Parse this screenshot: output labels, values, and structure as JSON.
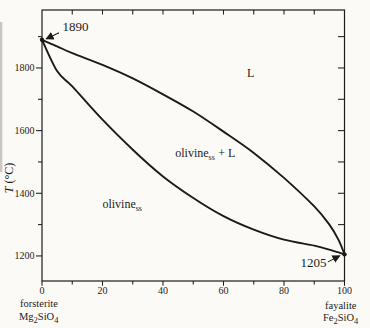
{
  "figure": {
    "background": "#fbfaf7",
    "line_color": "#1b1a18"
  },
  "chart_data": {
    "type": "line",
    "x_axis": {
      "min": 0,
      "max": 100,
      "major_ticks": [
        0,
        20,
        40,
        60,
        80,
        100
      ],
      "minor_ticks": [
        10,
        30,
        50,
        70,
        90
      ],
      "top_minor_ticks": [
        10,
        20,
        30,
        40,
        50,
        60,
        70,
        80,
        90
      ],
      "left_end": {
        "name": "forsterite",
        "formula_parts": [
          {
            "t": "Mg"
          },
          {
            "t": "2",
            "sub": true
          },
          {
            "t": "SiO"
          },
          {
            "t": "4",
            "sub": true
          }
        ]
      },
      "right_end": {
        "name": "fayalite",
        "formula_parts": [
          {
            "t": "Fe"
          },
          {
            "t": "2",
            "sub": true
          },
          {
            "t": "SiO"
          },
          {
            "t": "4",
            "sub": true
          }
        ]
      }
    },
    "y_axis": {
      "min": 1120,
      "max": 1985,
      "label_parts": [
        {
          "t": "T",
          "italic": true
        },
        {
          "t": "(°C)"
        }
      ],
      "labeled_ticks": [
        1200,
        1400,
        1600,
        1800
      ],
      "minor_ticks": [
        1300,
        1500,
        1700,
        1900
      ],
      "right_minor_ticks": [
        1300,
        1400,
        1500,
        1600,
        1700,
        1800,
        1900
      ]
    },
    "series": [
      {
        "name": "liquidus",
        "points": [
          [
            0,
            1890
          ],
          [
            5,
            1869
          ],
          [
            10,
            1847
          ],
          [
            20,
            1810
          ],
          [
            30,
            1767
          ],
          [
            40,
            1716
          ],
          [
            50,
            1661
          ],
          [
            60,
            1597
          ],
          [
            70,
            1529
          ],
          [
            80,
            1449
          ],
          [
            90,
            1358
          ],
          [
            95,
            1300
          ],
          [
            98,
            1252
          ],
          [
            100,
            1205
          ]
        ]
      },
      {
        "name": "solidus",
        "points": [
          [
            0,
            1890
          ],
          [
            5,
            1790
          ],
          [
            10,
            1741
          ],
          [
            20,
            1635
          ],
          [
            30,
            1539
          ],
          [
            40,
            1454
          ],
          [
            50,
            1385
          ],
          [
            60,
            1327
          ],
          [
            70,
            1284
          ],
          [
            80,
            1252
          ],
          [
            90,
            1233
          ],
          [
            95,
            1220
          ],
          [
            100,
            1205
          ]
        ]
      }
    ],
    "point_annotations": [
      {
        "label": "1890",
        "x": 0,
        "T": 1890
      },
      {
        "label": "1205",
        "x": 100,
        "T": 1205
      }
    ],
    "region_labels": [
      {
        "id": "L",
        "x": 69,
        "T": 1784,
        "parts": [
          {
            "t": "L"
          }
        ]
      },
      {
        "id": "olivine-ss-plus-L",
        "x": 54,
        "T": 1527,
        "parts": [
          {
            "t": "olivine"
          },
          {
            "t": "ss",
            "sub": true
          },
          {
            "t": "+ L"
          }
        ]
      },
      {
        "id": "olivine-ss",
        "x": 26.5,
        "T": 1367,
        "parts": [
          {
            "t": "olivine"
          },
          {
            "t": "ss",
            "sub": true
          }
        ]
      }
    ]
  }
}
